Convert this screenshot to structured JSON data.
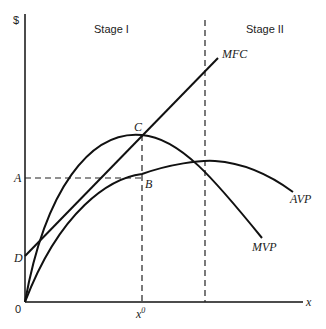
{
  "diagram": {
    "y_axis_label": "$",
    "x_axis_label": "x",
    "origin_label": "0",
    "stages": [
      {
        "label": "Stage I"
      },
      {
        "label": "Stage II"
      }
    ],
    "curves": {
      "mfc": "MFC",
      "avp": "AVP",
      "mvp": "MVP"
    },
    "points": {
      "a": "A",
      "b": "B",
      "c": "C",
      "d": "D"
    },
    "x0_label": "x",
    "x0_superscript": "0"
  }
}
